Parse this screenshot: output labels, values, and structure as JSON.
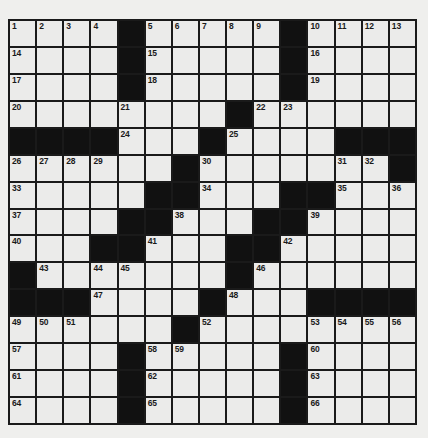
{
  "puzzle": {
    "size": {
      "rows": 15,
      "cols": 15
    },
    "colors": {
      "background": "#efefed",
      "cell": "#ebebea",
      "block": "#111111",
      "line": "#1a1a1a"
    },
    "grid": [
      [
        "1",
        "2",
        "3",
        "4",
        "#",
        "5",
        "6",
        "7",
        "8",
        "9",
        "#",
        "10",
        "11",
        "12",
        "13"
      ],
      [
        "14",
        "",
        "",
        "",
        "#",
        "15",
        "",
        "",
        "",
        "",
        "#",
        "16",
        "",
        "",
        ""
      ],
      [
        "17",
        "",
        "",
        "",
        "#",
        "18",
        "",
        "",
        "",
        "",
        "#",
        "19",
        "",
        "",
        ""
      ],
      [
        "20",
        "",
        "",
        "",
        "21",
        "",
        "",
        "",
        "#",
        "22",
        "23",
        "",
        "",
        "",
        ""
      ],
      [
        "#",
        "#",
        "#",
        "#",
        "24",
        "",
        "",
        "#",
        "25",
        "",
        "",
        "",
        "#",
        "#",
        "#"
      ],
      [
        "26",
        "27",
        "28",
        "29",
        "",
        "",
        "#",
        "30",
        "",
        "",
        "",
        "",
        "31",
        "32",
        "#"
      ],
      [
        "33",
        "",
        "",
        "",
        "",
        "#",
        "#",
        "34",
        "",
        "",
        "#",
        "#",
        "35",
        "",
        "36"
      ],
      [
        "37",
        "",
        "",
        "",
        "#",
        "#",
        "38",
        "",
        "",
        "#",
        "#",
        "39",
        "",
        "",
        ""
      ],
      [
        "40",
        "",
        "",
        "#",
        "#",
        "41",
        "",
        "",
        "#",
        "#",
        "42",
        "",
        "",
        "",
        ""
      ],
      [
        "#",
        "43",
        "",
        "44",
        "45",
        "",
        "",
        "",
        "#",
        "46",
        "",
        "",
        "",
        "",
        ""
      ],
      [
        "#",
        "#",
        "#",
        "47",
        "",
        "",
        "",
        "#",
        "48",
        "",
        "",
        "#",
        "#",
        "#",
        "#"
      ],
      [
        "49",
        "50",
        "51",
        "",
        "",
        "",
        "#",
        "52",
        "",
        "",
        "",
        "53",
        "54",
        "55",
        "56"
      ],
      [
        "57",
        "",
        "",
        "",
        "#",
        "58",
        "59",
        "",
        "",
        "",
        "#",
        "60",
        "",
        "",
        ""
      ],
      [
        "61",
        "",
        "",
        "",
        "#",
        "62",
        "",
        "",
        "",
        "",
        "#",
        "63",
        "",
        "",
        ""
      ],
      [
        "64",
        "",
        "",
        "",
        "#",
        "65",
        "",
        "",
        "",
        "",
        "#",
        "66",
        "",
        "",
        ""
      ]
    ]
  }
}
